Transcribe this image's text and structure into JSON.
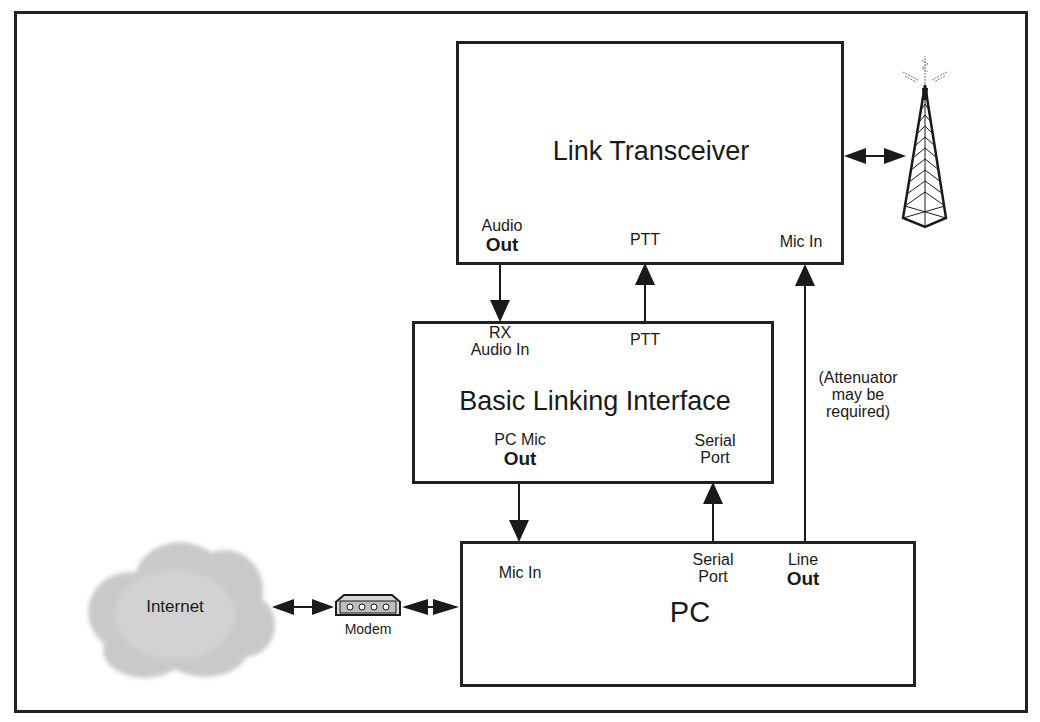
{
  "diagram": {
    "link_transceiver": {
      "title": "Link Transceiver",
      "ports": {
        "audio_out_top": "Audio",
        "audio_out_bottom": "Out",
        "ptt": "PTT",
        "mic_in": "Mic In"
      }
    },
    "interface": {
      "title": "Basic Linking Interface",
      "ports": {
        "rx_top": "RX",
        "rx_bottom": "Audio In",
        "ptt": "PTT",
        "pc_mic_top": "PC Mic",
        "pc_mic_bottom": "Out",
        "serial_top": "Serial",
        "serial_bottom": "Port"
      }
    },
    "pc": {
      "title": "PC",
      "ports": {
        "mic_in": "Mic In",
        "serial_top": "Serial",
        "serial_bottom": "Port",
        "line_top": "Line",
        "line_bottom": "Out"
      }
    },
    "attenuator_note": [
      "(Attenuator",
      "may be",
      "required)"
    ],
    "internet": {
      "label": "Internet"
    },
    "modem": {
      "label": "Modem"
    },
    "antenna": {
      "icon": "radio-tower-icon"
    },
    "connections": [
      {
        "from": "Link Transceiver: Audio Out",
        "to": "Basic Linking Interface: RX Audio In",
        "direction": "down"
      },
      {
        "from": "Basic Linking Interface: PTT",
        "to": "Link Transceiver: PTT",
        "direction": "up"
      },
      {
        "from": "PC: Line Out",
        "to": "Link Transceiver: Mic In",
        "direction": "up"
      },
      {
        "from": "Basic Linking Interface: PC Mic Out",
        "to": "PC: Mic In",
        "direction": "down"
      },
      {
        "from": "PC: Serial Port",
        "to": "Basic Linking Interface: Serial Port",
        "direction": "up"
      },
      {
        "from": "Link Transceiver",
        "to": "Antenna",
        "direction": "bidirectional"
      },
      {
        "from": "Internet",
        "to": "Modem",
        "direction": "bidirectional"
      },
      {
        "from": "Modem",
        "to": "PC",
        "direction": "bidirectional"
      }
    ]
  }
}
